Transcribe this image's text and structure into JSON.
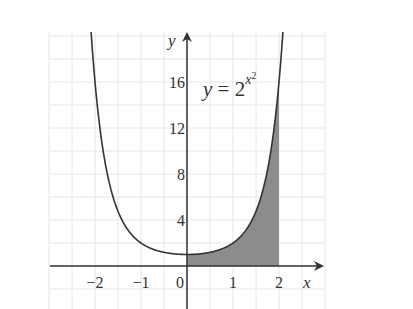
{
  "chart_data": {
    "type": "area",
    "title": "",
    "function": "y = 2^(x^2)",
    "annotation": {
      "text_lhs": "y",
      "text_eq": " = 2",
      "exponent": "x",
      "exponent_power": "2"
    },
    "xlabel": "x",
    "ylabel": "y",
    "xlim": [
      -3.0,
      3.0
    ],
    "ylim": [
      -3.7,
      20.3
    ],
    "x_ticks": [
      {
        "value": -2,
        "label": "−2"
      },
      {
        "value": -1,
        "label": "−1"
      },
      {
        "value": 0,
        "label": "0"
      },
      {
        "value": 1,
        "label": "1"
      },
      {
        "value": 2,
        "label": "2"
      }
    ],
    "y_ticks": [
      {
        "value": 4,
        "label": "4"
      },
      {
        "value": 8,
        "label": "8"
      },
      {
        "value": 12,
        "label": "12"
      },
      {
        "value": 16,
        "label": "16"
      }
    ],
    "grid": {
      "x_step": 0.5,
      "y_step": 2,
      "color": "#e6e6e6"
    },
    "series": [
      {
        "name": "y = 2^(x^2)",
        "x": [
          -2.1,
          -2.0,
          -1.75,
          -1.5,
          -1.25,
          -1.0,
          -0.75,
          -0.5,
          -0.25,
          0,
          0.25,
          0.5,
          0.75,
          1.0,
          1.25,
          1.5,
          1.75,
          2.0,
          2.1
        ],
        "values": [
          21.2,
          16,
          8.5,
          4.76,
          2.95,
          2,
          1.48,
          1.19,
          1.04,
          1,
          1.04,
          1.19,
          1.48,
          2,
          2.95,
          4.76,
          8.5,
          16,
          21.2
        ]
      }
    ],
    "shaded_region": {
      "from_x": 0,
      "to_x": 2,
      "description": "area under curve between x=0 and x=2",
      "color": "#8c8c8c"
    },
    "colors": {
      "curve": "#333333",
      "axis": "#333333",
      "fill": "#8c8c8c"
    }
  }
}
